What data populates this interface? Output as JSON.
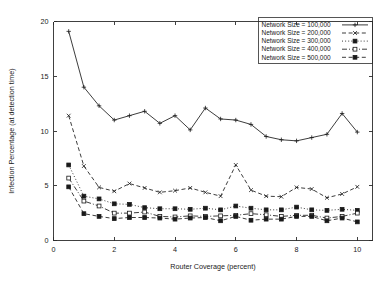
{
  "chart_data": {
    "type": "line",
    "title": "",
    "xlabel": "Router Coverage (percent)",
    "ylabel": "Infection Percentage (at detection time)",
    "xlim": [
      0,
      10.5
    ],
    "ylim": [
      0,
      20
    ],
    "xticks": [
      0,
      2,
      4,
      6,
      8,
      10
    ],
    "xtick_labels": [
      "0",
      "2",
      "4",
      "6",
      "8",
      "10"
    ],
    "yticks": [
      0,
      5,
      10,
      15,
      20
    ],
    "ytick_labels": [
      "0",
      "5",
      "10",
      "15",
      "20"
    ],
    "grid": false,
    "legend_position": "top-right",
    "x": [
      0.5,
      1.0,
      1.5,
      2.0,
      2.5,
      3.0,
      3.5,
      4.0,
      4.5,
      5.0,
      5.5,
      6.0,
      6.5,
      7.0,
      7.5,
      8.0,
      8.5,
      9.0,
      9.5,
      10.0
    ],
    "series": [
      {
        "name": "Network Size = 100,000",
        "marker": "plus",
        "dash": "solid",
        "values": [
          19.1,
          14.0,
          12.3,
          11.0,
          11.4,
          11.8,
          10.7,
          11.4,
          10.1,
          12.1,
          11.1,
          11.0,
          10.6,
          9.5,
          9.2,
          9.1,
          9.4,
          9.7,
          11.6,
          9.9
        ]
      },
      {
        "name": "Network Size = 200,000",
        "marker": "cross",
        "dash": "dashed",
        "values": [
          11.4,
          6.8,
          4.85,
          4.5,
          5.2,
          4.8,
          4.4,
          4.55,
          4.8,
          4.4,
          4.05,
          6.9,
          4.6,
          4.05,
          4.0,
          4.85,
          4.7,
          3.9,
          4.25,
          4.9
        ]
      },
      {
        "name": "Network Size = 300,000",
        "marker": "square-filled",
        "dash": "dotted",
        "values": [
          6.9,
          4.05,
          3.8,
          3.35,
          3.3,
          3.0,
          2.9,
          2.9,
          2.85,
          2.95,
          2.8,
          3.15,
          2.95,
          2.8,
          2.8,
          3.05,
          2.8,
          2.75,
          2.85,
          2.75
        ]
      },
      {
        "name": "Network Size = 400,000",
        "marker": "square-open",
        "dash": "dashdot",
        "values": [
          5.7,
          3.6,
          3.15,
          2.5,
          2.5,
          2.6,
          2.2,
          2.15,
          2.25,
          2.2,
          2.25,
          2.3,
          2.45,
          2.35,
          2.2,
          2.3,
          2.3,
          2.05,
          2.2,
          2.5
        ]
      },
      {
        "name": "Network Size = 500,000",
        "marker": "square-filled",
        "dash": "dashed",
        "values": [
          4.9,
          2.45,
          2.2,
          2.0,
          2.1,
          2.1,
          2.05,
          1.95,
          2.05,
          2.1,
          1.8,
          2.2,
          1.85,
          1.95,
          1.95,
          2.2,
          2.2,
          1.8,
          2.05,
          1.7
        ]
      }
    ]
  },
  "legend": {
    "entries": [
      "Network Size = 100,000",
      "Network Size = 200,000",
      "Network Size = 300,000",
      "Network Size = 400,000",
      "Network Size = 500,000"
    ]
  }
}
